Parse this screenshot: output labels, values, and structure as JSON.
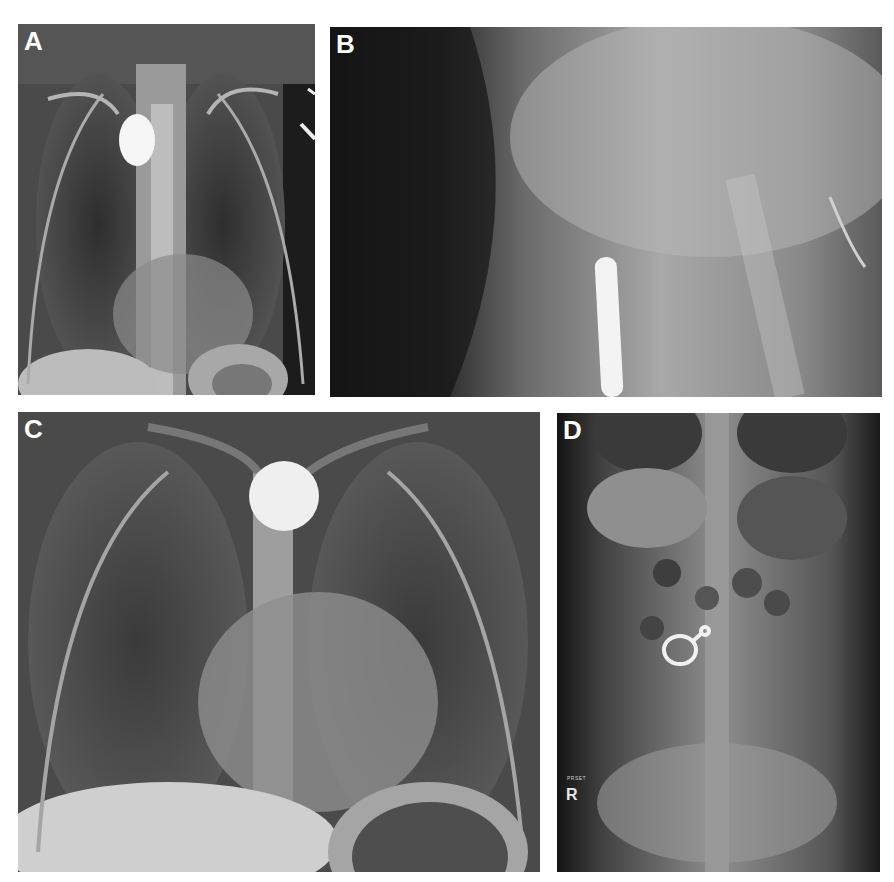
{
  "figure": {
    "panels": [
      {
        "id": "A",
        "label": "A",
        "description": "Frontal chest radiograph with round radiopaque foreign body (coin) in upper esophagus"
      },
      {
        "id": "B",
        "label": "B",
        "description": "Lateral view showing coin edge-on as vertical radiopaque bar"
      },
      {
        "id": "C",
        "label": "C",
        "description": "Frontal chest radiograph with round radiopaque coin at thoracic inlet"
      },
      {
        "id": "D",
        "label": "D",
        "description": "Abdominal radiograph with ring-shaped radiopaque foreign body",
        "side_marker": "R",
        "small_marker": "PRSET"
      }
    ]
  },
  "colors": {
    "background": "#ffffff",
    "label": "#ffffff",
    "foreign_body": "#f2f2f2",
    "film_dark": "#1a1a1a"
  }
}
